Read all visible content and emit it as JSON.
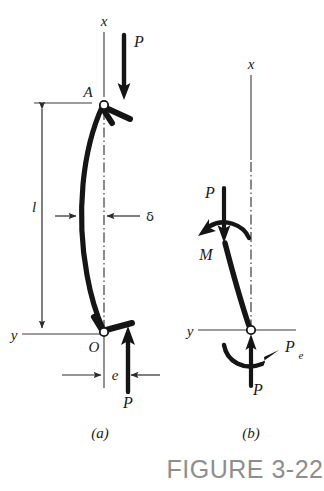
{
  "figure": {
    "caption": "FIGURE 3-22",
    "caption_color": "#8e8e8e",
    "ink_color": "#151515",
    "background_color": "#ffffff",
    "panels": [
      {
        "id": "a",
        "sublabel": "(a)",
        "description": "Pin-ended eccentrically loaded column in deflected shape",
        "labels": {
          "axis_x": "x",
          "axis_y": "y",
          "point_top": "A",
          "point_bottom": "O",
          "length": "l",
          "deflection": "δ",
          "eccentricity": "e",
          "force_top": "P",
          "force_bottom": "P"
        }
      },
      {
        "id": "b",
        "sublabel": "(b)",
        "description": "Free body diagram with equivalent axial force and moment",
        "labels": {
          "axis_x": "x",
          "axis_y": "y",
          "force_top": "P",
          "moment_top": "M",
          "force_bottom": "P",
          "moment_bottom": "P",
          "moment_bottom_sub": "e"
        }
      }
    ]
  }
}
